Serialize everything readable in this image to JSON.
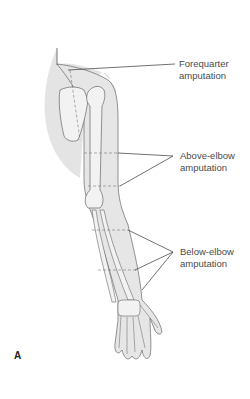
{
  "figure": {
    "panel_letter": "A",
    "labels": [
      {
        "id": "forequarter",
        "line1": "Forequarter",
        "line2": "amputation"
      },
      {
        "id": "above-elbow",
        "line1": "Above-elbow",
        "line2": "amputation"
      },
      {
        "id": "below-elbow",
        "line1": "Below-elbow",
        "line2": "amputation"
      }
    ],
    "colors": {
      "shading": "#e4e4e4",
      "outline": "#555555",
      "leader": "#333333",
      "text": "#4a4a4a"
    }
  }
}
